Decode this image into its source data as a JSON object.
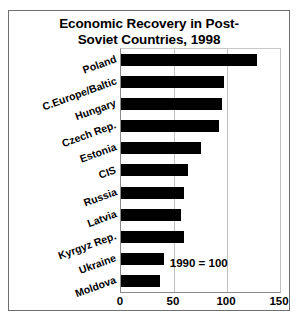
{
  "chart_data": {
    "type": "bar",
    "orientation": "horizontal",
    "title_lines": [
      "Economic Recovery in Post-",
      "Soviet Countries, 1998"
    ],
    "categories": [
      "Poland",
      "C.Europe/Baltic",
      "Hungary",
      "Czech Rep.",
      "Estonia",
      "CIS",
      "Russia",
      "Latvia",
      "Kyrgyz Rep.",
      "Ukraine",
      "Moldova"
    ],
    "values": [
      128,
      97,
      95,
      92,
      75,
      63,
      59,
      57,
      59,
      41,
      37
    ],
    "xlabel": "",
    "ylabel": "",
    "xlim": [
      0,
      150
    ],
    "xticks": [
      0,
      50,
      100,
      150
    ],
    "xtick_labels": [
      "0",
      "50",
      "100",
      "150"
    ],
    "grid": true,
    "grid_axis": "x",
    "legend": null,
    "annotation": "1990 = 100",
    "bar_color": "#000000",
    "background_color": "#ffffff",
    "border_color": "#6e6e6e"
  }
}
